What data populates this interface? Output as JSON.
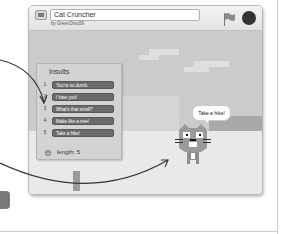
{
  "window": {
    "project_title": "Cat Cruncher",
    "byline": "by GreenDino09",
    "icons": {
      "fullscreen": "fullscreen-icon",
      "green_flag": "green-flag-icon",
      "stop": "stop-sign-icon"
    }
  },
  "list_monitor": {
    "title": "Insults",
    "items": [
      {
        "index": "1",
        "value": "You're so dumb."
      },
      {
        "index": "2",
        "value": "I hate you!"
      },
      {
        "index": "3",
        "value": "What's that smell?"
      },
      {
        "index": "4",
        "value": "Make like a tree!"
      },
      {
        "index": "5",
        "value": "Take a hike!"
      }
    ],
    "add_symbol": "+",
    "length_label": "length: 5"
  },
  "sprite": {
    "speech": "Take a hike!"
  },
  "colors": {
    "list_item_bg": "#6b6b6b",
    "stage_sky": "#cbcbcb",
    "stop": "#333333"
  }
}
